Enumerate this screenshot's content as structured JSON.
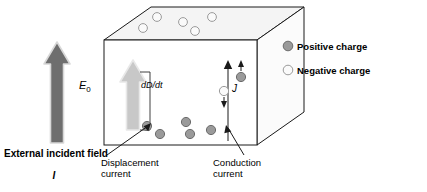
{
  "diagram": {
    "type": "physics-schematic",
    "background_color": "#ffffff"
  },
  "colors": {
    "outline": "#1a1a1a",
    "positive_charge_fill": "#9a9a9a",
    "positive_charge_stroke": "#6b6b6b",
    "negative_charge_fill": "#fafafa",
    "negative_charge_stroke": "#9a9a9a",
    "e0_arrow_fill": "#6e6e6e",
    "e0_arrow_stroke": "#d8d8d8",
    "dddt_arrow_fill": "#c8c8c8",
    "dddt_arrow_stroke": "#e6e6e6",
    "top_face_fill": "#f4f4f4",
    "front_face_fill": "#ffffff",
    "side_face_fill": "#fbfbfb",
    "leader_line": "#1a1a1a"
  },
  "labels": {
    "e0": "E",
    "e0_subscript": "0",
    "displacement_current_symbol": "dD/dt",
    "conduction_current_symbol": "J",
    "external_field_caption": "External incident field",
    "external_field_symbol": "I",
    "displacement_current_caption_line1": "Displacement",
    "displacement_current_caption_line2": "current",
    "conduction_current_caption_line1": "Conduction",
    "conduction_current_caption_line2": "current"
  },
  "legend": {
    "position": "right",
    "items": [
      {
        "label": "Positive charge",
        "marker": "filled-gray-circle",
        "color": "#9a9a9a"
      },
      {
        "label": "Negative charge",
        "marker": "open-light-circle",
        "color": "#fafafa"
      }
    ]
  },
  "charges": {
    "negative_top_face": [
      {
        "cx": 157,
        "cy": 17,
        "r": 4.4
      },
      {
        "cx": 143,
        "cy": 28,
        "r": 4.4
      },
      {
        "cx": 183,
        "cy": 22,
        "r": 4.4
      },
      {
        "cx": 195,
        "cy": 31,
        "r": 4.4
      },
      {
        "cx": 212,
        "cy": 17,
        "r": 4.4
      }
    ],
    "positive_bottom": [
      {
        "cx": 147,
        "cy": 126,
        "r": 4.6
      },
      {
        "cx": 160,
        "cy": 134,
        "r": 4.6
      },
      {
        "cx": 186,
        "cy": 122,
        "r": 4.6
      },
      {
        "cx": 190,
        "cy": 134,
        "r": 4.6
      },
      {
        "cx": 211,
        "cy": 130,
        "r": 4.6
      }
    ],
    "conduction_positive": {
      "cx": 241,
      "cy": 77,
      "r": 4.6
    },
    "conduction_negative": {
      "cx": 224,
      "cy": 91,
      "r": 4.6
    }
  },
  "geometry": {
    "box_front": {
      "x": 104,
      "y": 40,
      "w": 153,
      "h": 105
    },
    "box_depth_dx": 47,
    "box_depth_dy": -33,
    "e0_arrow": {
      "x": 57,
      "y_top": 42,
      "y_bottom": 143,
      "shaft_w": 12,
      "head_w": 26,
      "head_h": 22
    },
    "dddt_arrow": {
      "x": 133,
      "y_top": 60,
      "y_bottom": 130,
      "shaft_w": 12,
      "head_w": 26,
      "head_h": 22
    },
    "conduction_line": {
      "x": 228,
      "y_top": 62,
      "y_bottom": 141
    }
  }
}
